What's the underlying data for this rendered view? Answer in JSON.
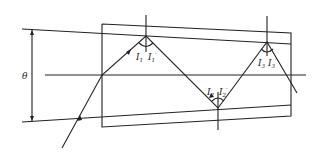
{
  "diagram": {
    "type": "optical-reflection",
    "angle_label": "θ",
    "reflections": [
      {
        "incident_label": "I",
        "incident_sub": "1",
        "reflected_label": "I",
        "reflected_sub": "1",
        "reflected_prime": "′"
      },
      {
        "incident_label": "I",
        "incident_sub": "2",
        "reflected_label": "I",
        "reflected_sub": "2",
        "reflected_prime": "′"
      },
      {
        "incident_label": "I",
        "incident_sub": "3",
        "reflected_label": "I",
        "reflected_sub": "3",
        "reflected_prime": "′"
      }
    ],
    "colors": {
      "line": "#222222",
      "background": "#ffffff"
    }
  }
}
